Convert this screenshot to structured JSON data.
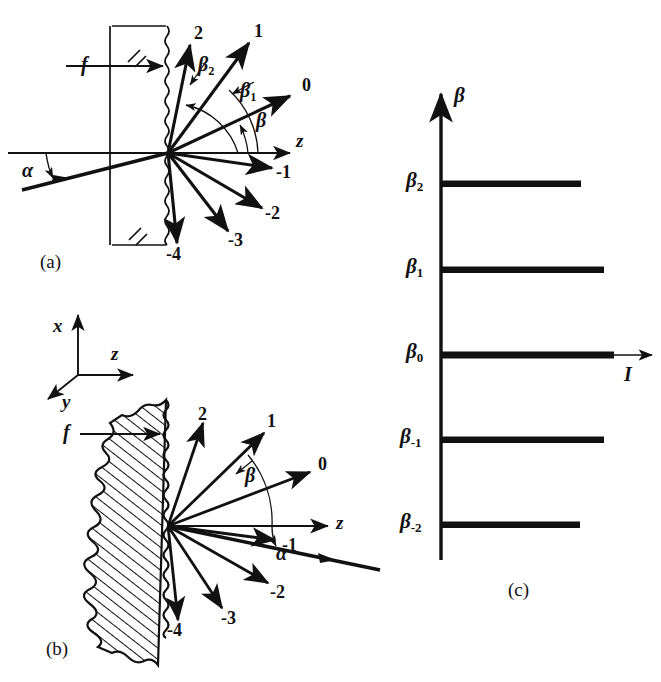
{
  "figure": {
    "panels": [
      {
        "key": "a",
        "label": "(a)",
        "caption": "transmission grating"
      },
      {
        "key": "b",
        "label": "(b)",
        "caption": "reflection grating"
      },
      {
        "key": "c",
        "label": "(c)",
        "caption": "intensity versus diffraction angle"
      }
    ],
    "ink_color": "#111111",
    "background_color": "#ffffff"
  },
  "panel_a": {
    "label": "(a)",
    "incident_label": "f",
    "incident_angle_label": "α",
    "axis_label": "z",
    "beta_label": "β",
    "beta_1_label": "β",
    "beta_1_sub": "1",
    "beta_2_label": "β",
    "beta_2_sub": "2",
    "order_labels": [
      "2",
      "1",
      "0",
      "-1",
      "-2",
      "-3",
      "-4"
    ],
    "orders": [
      {
        "name": "2",
        "angle_deg": 70
      },
      {
        "name": "1",
        "angle_deg": 48
      },
      {
        "name": "0",
        "angle_deg": 23
      },
      {
        "name": "-1",
        "angle_deg": -6
      },
      {
        "name": "-2",
        "angle_deg": -29
      },
      {
        "name": "-3",
        "angle_deg": -50
      },
      {
        "name": "-4",
        "angle_deg": -82
      }
    ]
  },
  "panel_b": {
    "label": "(b)",
    "incident_label": "f",
    "incident_angle_label": "α",
    "axis_label": "z",
    "beta_label": "β",
    "triad": {
      "x": "x",
      "y": "y",
      "z": "z"
    },
    "order_labels": [
      "2",
      "1",
      "0",
      "-1",
      "-2",
      "-3",
      "-4"
    ],
    "orders": [
      {
        "name": "2",
        "angle_deg": 62
      },
      {
        "name": "1",
        "angle_deg": 42
      },
      {
        "name": "0",
        "angle_deg": 22
      },
      {
        "name": "-1",
        "angle_deg": -5
      },
      {
        "name": "-2",
        "angle_deg": -27
      },
      {
        "name": "-3",
        "angle_deg": -54
      },
      {
        "name": "-4",
        "angle_deg": -83
      }
    ]
  },
  "panel_c": {
    "label": "(c)",
    "y_axis_label": "β",
    "x_axis_label": "I",
    "tick_labels": [
      {
        "base": "β",
        "sub": "2"
      },
      {
        "base": "β",
        "sub": "1"
      },
      {
        "base": "β",
        "sub": "0"
      },
      {
        "base": "β",
        "sub": "-1"
      },
      {
        "base": "β",
        "sub": "-2"
      }
    ]
  },
  "chart_data": {
    "type": "bar",
    "orientation": "horizontal",
    "title": "",
    "xlabel": "I",
    "ylabel": "β",
    "categories": [
      "β₂",
      "β₁",
      "β₀",
      "β₋₁",
      "β₋₂"
    ],
    "values": [
      140,
      163,
      173,
      163,
      139
    ],
    "value_unit": "relative intensity (px bar length)",
    "xlim": [
      0,
      210
    ],
    "grid": false,
    "legend": false
  }
}
